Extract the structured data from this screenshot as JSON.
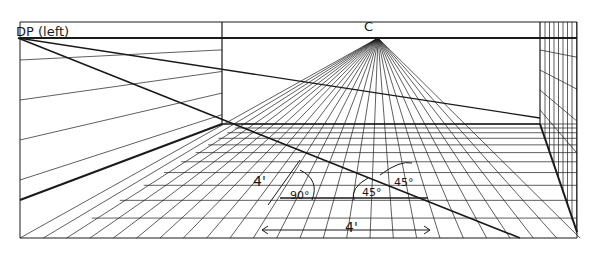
{
  "diagram": {
    "type": "one-point perspective floor grid with distance point",
    "labels": {
      "distance_point": "DP (left)",
      "center_vp": "C",
      "depth_measure": "4'",
      "width_measure": "4'",
      "right_angle": "90°",
      "angle_inner": "45°",
      "angle_outer": "45°"
    },
    "colors": {
      "ink": "#1a1a1a",
      "paper": "#ffffff"
    },
    "geometry": {
      "horizon_y": 38,
      "vanishing_point": [
        378,
        38
      ],
      "distance_point": [
        18,
        38
      ],
      "back_wall": {
        "left": 222,
        "right": 540,
        "floor_y": 124
      },
      "frame": {
        "left": 20,
        "right": 577,
        "top": 20,
        "bottom": 238
      }
    }
  }
}
